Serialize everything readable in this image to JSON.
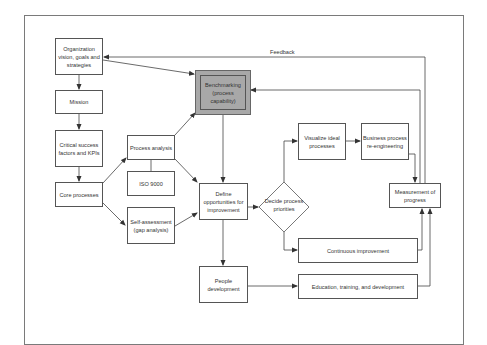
{
  "diagram": {
    "nodes": {
      "org_vision": "Organization vision, goals and strategies",
      "mission": "Mission",
      "csf": "Critical success factors and KPIs",
      "core": "Core processes",
      "process_analysis": "Process analysis",
      "iso": "ISO 9000",
      "self_assessment": "Self-assessment (gap analysis)",
      "benchmarking": "Benchmarking (process capability)",
      "define": "Define opportunities for improvement",
      "decide": "Decide process priorities",
      "visualize": "Visualize ideal processes",
      "bpr": "Business process re-engineering",
      "measurement": "Measurement of progress",
      "continuous": "Continuous improvement",
      "people": "People development",
      "education": "Education, training, and development"
    },
    "labels": {
      "feedback": "Feedback"
    },
    "edges": [
      [
        "org_vision",
        "mission"
      ],
      [
        "mission",
        "csf"
      ],
      [
        "csf",
        "core"
      ],
      [
        "core",
        "process_analysis"
      ],
      [
        "core",
        "self_assessment"
      ],
      [
        "org_vision",
        "benchmarking"
      ],
      [
        "process_analysis",
        "benchmarking"
      ],
      [
        "process_analysis",
        "define"
      ],
      [
        "self_assessment",
        "define"
      ],
      [
        "benchmarking",
        "define"
      ],
      [
        "define",
        "decide"
      ],
      [
        "define",
        "people"
      ],
      [
        "decide",
        "visualize"
      ],
      [
        "decide",
        "continuous"
      ],
      [
        "visualize",
        "bpr"
      ],
      [
        "bpr",
        "measurement"
      ],
      [
        "continuous",
        "measurement"
      ],
      [
        "education",
        "measurement"
      ],
      [
        "people",
        "education"
      ],
      [
        "measurement",
        "org_vision",
        "Feedback"
      ],
      [
        "measurement",
        "benchmarking"
      ]
    ]
  }
}
